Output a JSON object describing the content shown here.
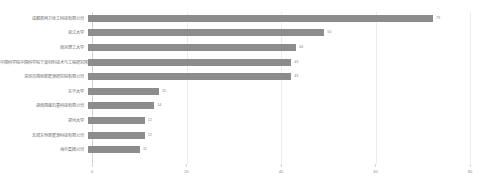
{
  "chart_data": {
    "type": "bar",
    "orientation": "horizontal",
    "title": "",
    "xlabel": "",
    "ylabel": "",
    "xlim": [
      0,
      80
    ],
    "grid": true,
    "legend": false,
    "xticks": [
      "0",
      "20",
      "40",
      "60",
      "80"
    ],
    "xtick_values": [
      0,
      20,
      40,
      60,
      80
    ],
    "categories": [
      "成都新柯力化工科技有限公司",
      "浙江大学",
      "南京理工大学",
      "中国科学院中国科学院宁波材料技术与工程研究所",
      "深圳市国创新能源研究院有限公司",
      "东华大学",
      "湖南国盛石墨科技有限公司",
      "郑州大学",
      "无锡东恒新能源科技有限公司",
      "海尔集团公司"
    ],
    "values": [
      73,
      50,
      44,
      43,
      43,
      15,
      14,
      12,
      12,
      11
    ],
    "bar_color": "#8c8c8c",
    "value_labels": [
      "73",
      "50",
      "44",
      "43",
      "43",
      "15",
      "14",
      "12",
      "12",
      "11"
    ]
  },
  "colors": {
    "bar": "#8c8c8c",
    "grid": "#ededed",
    "axis": "#d2d2d2",
    "label_text": "#6b6b6b",
    "tick_text": "#8a8a8a",
    "background": "#ffffff"
  }
}
